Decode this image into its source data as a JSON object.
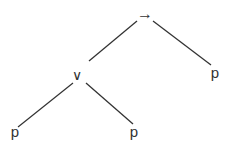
{
  "diagram": {
    "type": "syntax-tree",
    "root": {
      "label": "→",
      "children": [
        {
          "label": "∨",
          "children": [
            {
              "label": "p"
            },
            {
              "label": "p"
            }
          ]
        },
        {
          "label": "p"
        }
      ]
    },
    "nodes": {
      "root": "→",
      "or": "∨",
      "leaf_left": "p",
      "leaf_middle": "p",
      "leaf_right": "p"
    },
    "colors": {
      "line": "#333333",
      "text": "#333333",
      "background": "#ffffff"
    }
  }
}
